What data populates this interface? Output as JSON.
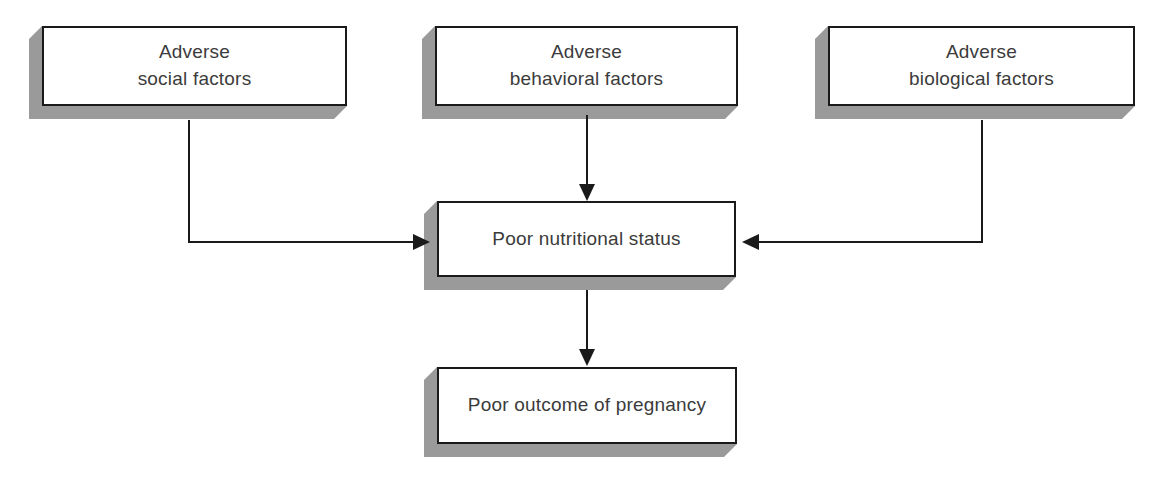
{
  "diagram": {
    "type": "flowchart",
    "title": "",
    "colors": {
      "box_fill": "#ffffff",
      "box_border": "#1a1a1a",
      "box_shadow": "#9a9a9a",
      "text": "#3b3b3b",
      "connector": "#1a1a1a",
      "background": "#ffffff"
    },
    "nodes": [
      {
        "id": "adverse-social-factors",
        "label": "Adverse\nsocial factors",
        "line1": "Adverse",
        "line2": "social factors"
      },
      {
        "id": "adverse-behavioral-factors",
        "label": "Adverse\nbehavioral factors",
        "line1": "Adverse",
        "line2": "behavioral factors"
      },
      {
        "id": "adverse-biological-factors",
        "label": "Adverse\nbiological factors",
        "line1": "Adverse",
        "line2": "biological factors"
      },
      {
        "id": "poor-nutritional-status",
        "label": "Poor nutritional status"
      },
      {
        "id": "poor-outcome-of-pregnancy",
        "label": "Poor outcome of pregnancy"
      }
    ],
    "edges": [
      {
        "id": "social-to-nutrition",
        "from": "adverse-social-factors",
        "to": "poor-nutritional-status",
        "shape": "down-then-right",
        "arrow": "right"
      },
      {
        "id": "behavioral-to-nutrition",
        "from": "adverse-behavioral-factors",
        "to": "poor-nutritional-status",
        "shape": "straight-down",
        "arrow": "down"
      },
      {
        "id": "biological-to-nutrition",
        "from": "adverse-biological-factors",
        "to": "poor-nutritional-status",
        "shape": "down-then-left",
        "arrow": "left"
      },
      {
        "id": "nutrition-to-outcome",
        "from": "poor-nutritional-status",
        "to": "poor-outcome-of-pregnancy",
        "shape": "straight-down",
        "arrow": "down"
      }
    ]
  }
}
